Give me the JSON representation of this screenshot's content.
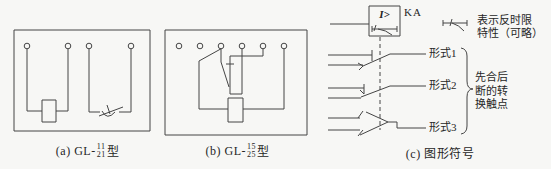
{
  "colors": {
    "background": "#f7f7f5",
    "line": "#454545",
    "text": "#262626"
  },
  "panel_a": {
    "caption_prefix": "(a) GL-",
    "model_numerator": "11",
    "model_denominator": "21",
    "caption_suffix": "型"
  },
  "panel_b": {
    "caption_prefix": "(b) GL-",
    "model_numerator": "15",
    "model_denominator": "25",
    "caption_suffix": "型"
  },
  "panel_c": {
    "relay_label": "KA",
    "relay_element_symbol": "I>",
    "forms": [
      {
        "label": "形式1"
      },
      {
        "label": "形式2"
      },
      {
        "label": "形式3"
      }
    ],
    "brace_note_lines": [
      "先合后",
      "断的转",
      "换触点"
    ],
    "annotation_lines": [
      "表示反时限",
      "特性（可略）"
    ],
    "caption": "(c) 图形符号"
  }
}
